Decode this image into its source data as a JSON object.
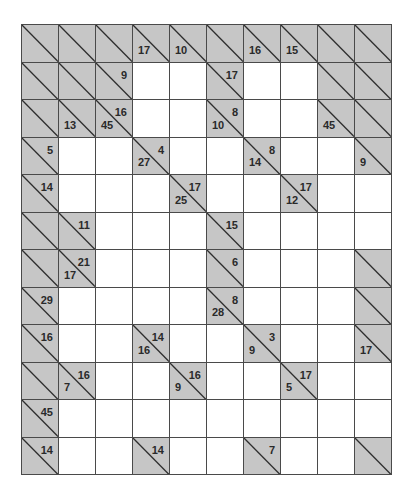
{
  "puzzle": {
    "type": "kakuro",
    "columns": 10,
    "rows": 12,
    "colors": {
      "block": "#c6c6c6",
      "line": "#4a4a4a",
      "white": "#ffffff",
      "text": "#2a2a2a"
    },
    "grid": [
      [
        {
          "t": "B"
        },
        {
          "t": "B"
        },
        {
          "t": "B"
        },
        {
          "t": "C",
          "d": "17"
        },
        {
          "t": "C",
          "d": "10"
        },
        {
          "t": "B"
        },
        {
          "t": "C",
          "d": "16"
        },
        {
          "t": "C",
          "d": "15"
        },
        {
          "t": "B"
        },
        {
          "t": "B"
        }
      ],
      [
        {
          "t": "B"
        },
        {
          "t": "B"
        },
        {
          "t": "C",
          "a": "9"
        },
        {
          "t": "W"
        },
        {
          "t": "W"
        },
        {
          "t": "C",
          "a": "17"
        },
        {
          "t": "W"
        },
        {
          "t": "W"
        },
        {
          "t": "B"
        },
        {
          "t": "B"
        }
      ],
      [
        {
          "t": "B"
        },
        {
          "t": "C",
          "d": "13"
        },
        {
          "t": "C",
          "d": "45",
          "a": "16"
        },
        {
          "t": "W"
        },
        {
          "t": "W"
        },
        {
          "t": "C",
          "d": "10",
          "a": "8"
        },
        {
          "t": "W"
        },
        {
          "t": "W"
        },
        {
          "t": "C",
          "d": "45"
        },
        {
          "t": "B"
        }
      ],
      [
        {
          "t": "C",
          "a": "5"
        },
        {
          "t": "W"
        },
        {
          "t": "W"
        },
        {
          "t": "C",
          "d": "27",
          "a": "4"
        },
        {
          "t": "W"
        },
        {
          "t": "W"
        },
        {
          "t": "C",
          "d": "14",
          "a": "8"
        },
        {
          "t": "W"
        },
        {
          "t": "W"
        },
        {
          "t": "C",
          "d": "9"
        }
      ],
      [
        {
          "t": "C",
          "a": "14"
        },
        {
          "t": "W"
        },
        {
          "t": "W"
        },
        {
          "t": "W"
        },
        {
          "t": "C",
          "d": "25",
          "a": "17"
        },
        {
          "t": "W"
        },
        {
          "t": "W"
        },
        {
          "t": "C",
          "d": "12",
          "a": "17"
        },
        {
          "t": "W"
        },
        {
          "t": "W"
        }
      ],
      [
        {
          "t": "B"
        },
        {
          "t": "C",
          "a": "11"
        },
        {
          "t": "W"
        },
        {
          "t": "W"
        },
        {
          "t": "W"
        },
        {
          "t": "C",
          "a": "15"
        },
        {
          "t": "W"
        },
        {
          "t": "W"
        },
        {
          "t": "W"
        },
        {
          "t": "W"
        }
      ],
      [
        {
          "t": "B"
        },
        {
          "t": "C",
          "d": "17",
          "a": "21"
        },
        {
          "t": "W"
        },
        {
          "t": "W"
        },
        {
          "t": "W"
        },
        {
          "t": "C",
          "a": "6"
        },
        {
          "t": "W"
        },
        {
          "t": "W"
        },
        {
          "t": "W"
        },
        {
          "t": "B"
        }
      ],
      [
        {
          "t": "C",
          "a": "29"
        },
        {
          "t": "W"
        },
        {
          "t": "W"
        },
        {
          "t": "W"
        },
        {
          "t": "W"
        },
        {
          "t": "C",
          "d": "28",
          "a": "8"
        },
        {
          "t": "W"
        },
        {
          "t": "W"
        },
        {
          "t": "W"
        },
        {
          "t": "B"
        }
      ],
      [
        {
          "t": "C",
          "a": "16"
        },
        {
          "t": "W"
        },
        {
          "t": "W"
        },
        {
          "t": "C",
          "d": "16",
          "a": "14"
        },
        {
          "t": "W"
        },
        {
          "t": "W"
        },
        {
          "t": "C",
          "d": "9",
          "a": "3"
        },
        {
          "t": "W"
        },
        {
          "t": "W"
        },
        {
          "t": "C",
          "d": "17"
        }
      ],
      [
        {
          "t": "B"
        },
        {
          "t": "C",
          "d": "7",
          "a": "16"
        },
        {
          "t": "W"
        },
        {
          "t": "W"
        },
        {
          "t": "C",
          "d": "9",
          "a": "16"
        },
        {
          "t": "W"
        },
        {
          "t": "W"
        },
        {
          "t": "C",
          "d": "5",
          "a": "17"
        },
        {
          "t": "W"
        },
        {
          "t": "W"
        }
      ],
      [
        {
          "t": "C",
          "a": "45"
        },
        {
          "t": "W"
        },
        {
          "t": "W"
        },
        {
          "t": "W"
        },
        {
          "t": "W"
        },
        {
          "t": "W"
        },
        {
          "t": "W"
        },
        {
          "t": "W"
        },
        {
          "t": "W"
        },
        {
          "t": "W"
        }
      ],
      [
        {
          "t": "C",
          "a": "14"
        },
        {
          "t": "W"
        },
        {
          "t": "W"
        },
        {
          "t": "C",
          "a": "14"
        },
        {
          "t": "W"
        },
        {
          "t": "W"
        },
        {
          "t": "C",
          "a": "7"
        },
        {
          "t": "W"
        },
        {
          "t": "W"
        },
        {
          "t": "B"
        }
      ]
    ]
  }
}
